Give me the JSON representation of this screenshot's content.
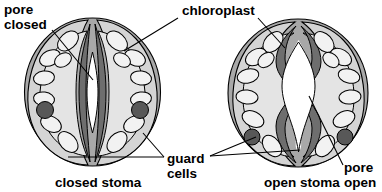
{
  "figure": {
    "title_present": false,
    "background": "#ffffff",
    "palette": {
      "outer_wall": "#a8a8a8",
      "cytoplasm": "#d4d4d4",
      "inner_cytoplasm": "#e0e0e0",
      "chloroplast_fill": "#f2f2f2",
      "nucleus": "#585858",
      "pore_wall": "#6e6e6e",
      "pore_open_fill": "#ffffff",
      "outline": "#000000",
      "text": "#000000"
    }
  },
  "labels": {
    "pore_closed": "pore\nclosed",
    "pore_closed_line1": "pore",
    "pore_closed_line2": "closed",
    "chloroplast": "chloroplast",
    "guard_cells_line1": "guard",
    "guard_cells_line2": "cells",
    "pore_open_line1": "pore",
    "pore_open_line2": "open",
    "closed_stoma": "closed stoma",
    "open_stoma": "open stoma"
  },
  "diagrams": [
    {
      "id": "closed-stoma",
      "caption": "closed stoma",
      "state": "closed",
      "pore_state": "closed",
      "guard_cell_count": 2,
      "nucleus_count": 2,
      "chloroplast_count": 14
    },
    {
      "id": "open-stoma",
      "caption": "open stoma",
      "state": "open",
      "pore_state": "open",
      "guard_cell_count": 2,
      "nucleus_count": 2,
      "chloroplast_count": 14
    }
  ]
}
